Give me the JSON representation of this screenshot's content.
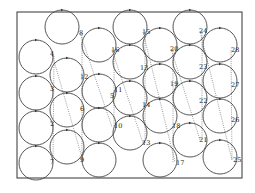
{
  "diagram": {
    "title": "",
    "frame": {
      "x": 17,
      "y": 12,
      "width": 225,
      "height": 166
    },
    "circle_radius": 17,
    "circles": [
      {
        "id": "c1",
        "cx": 36,
        "cy": 57
      },
      {
        "id": "c2",
        "cx": 36,
        "cy": 93
      },
      {
        "id": "c3",
        "cx": 36,
        "cy": 128
      },
      {
        "id": "c4",
        "cx": 36,
        "cy": 163
      },
      {
        "id": "c5",
        "cx": 62,
        "cy": 27
      },
      {
        "id": "c6",
        "cx": 67,
        "cy": 75
      },
      {
        "id": "c7",
        "cx": 67,
        "cy": 110
      },
      {
        "id": "c8",
        "cx": 67,
        "cy": 147
      },
      {
        "id": "c9",
        "cx": 99,
        "cy": 45
      },
      {
        "id": "c10",
        "cx": 99,
        "cy": 91
      },
      {
        "id": "c11",
        "cx": 99,
        "cy": 125
      },
      {
        "id": "c12",
        "cx": 99,
        "cy": 160
      },
      {
        "id": "c13",
        "cx": 130,
        "cy": 27
      },
      {
        "id": "c14",
        "cx": 130,
        "cy": 62
      },
      {
        "id": "c15",
        "cx": 130,
        "cy": 98
      },
      {
        "id": "c16",
        "cx": 130,
        "cy": 133
      },
      {
        "id": "c17",
        "cx": 160,
        "cy": 45
      },
      {
        "id": "c18",
        "cx": 160,
        "cy": 81
      },
      {
        "id": "c19",
        "cx": 160,
        "cy": 116
      },
      {
        "id": "c20",
        "cx": 160,
        "cy": 160
      },
      {
        "id": "c21",
        "cx": 190,
        "cy": 27
      },
      {
        "id": "c22",
        "cx": 190,
        "cy": 62
      },
      {
        "id": "c23",
        "cx": 190,
        "cy": 98
      },
      {
        "id": "c24",
        "cx": 190,
        "cy": 140
      },
      {
        "id": "c25",
        "cx": 220,
        "cy": 45
      },
      {
        "id": "c26",
        "cx": 220,
        "cy": 81
      },
      {
        "id": "c27",
        "cx": 220,
        "cy": 116
      },
      {
        "id": "c28",
        "cx": 220,
        "cy": 157
      }
    ],
    "labels": [
      {
        "text": "8",
        "x": 79,
        "y": 35
      },
      {
        "text": "4",
        "x": 50,
        "y": 56
      },
      {
        "text": "3",
        "x": 50,
        "y": 91
      },
      {
        "text": "2",
        "x": 50,
        "y": 126
      },
      {
        "text": "7",
        "x": 50,
        "y": 164
      },
      {
        "text": "12",
        "x": 80,
        "y": 79
      },
      {
        "text": "6",
        "x": 80,
        "y": 111
      },
      {
        "text": "9",
        "x": 80,
        "y": 162
      },
      {
        "text": "16",
        "x": 111,
        "y": 52
      },
      {
        "text": "5",
        "x": 110,
        "y": 98
      },
      {
        "text": "11",
        "x": 114,
        "y": 92
      },
      {
        "text": "10",
        "x": 114,
        "y": 128
      },
      {
        "text": "15",
        "x": 142,
        "y": 34
      },
      {
        "text": "13",
        "x": 140,
        "y": 70
      },
      {
        "text": "14",
        "x": 142,
        "y": 107
      },
      {
        "text": "13",
        "x": 142,
        "y": 145
      },
      {
        "text": "20",
        "x": 170,
        "y": 51
      },
      {
        "text": "19",
        "x": 170,
        "y": 86
      },
      {
        "text": "18",
        "x": 172,
        "y": 128
      },
      {
        "text": "17",
        "x": 176,
        "y": 165
      },
      {
        "text": "24",
        "x": 199,
        "y": 33
      },
      {
        "text": "23",
        "x": 199,
        "y": 69
      },
      {
        "text": "22",
        "x": 199,
        "y": 103
      },
      {
        "text": "21",
        "x": 199,
        "y": 142
      },
      {
        "text": "28",
        "x": 231,
        "y": 52
      },
      {
        "text": "27",
        "x": 231,
        "y": 87
      },
      {
        "text": "26",
        "x": 231,
        "y": 122
      },
      {
        "text": "25",
        "x": 233,
        "y": 162
      }
    ],
    "dotted_lines": [
      {
        "x1": 52,
        "y1": 54,
        "x2": 83,
        "y2": 161
      },
      {
        "x1": 54,
        "y1": 56,
        "x2": 53,
        "y2": 160
      },
      {
        "x1": 80,
        "y1": 33,
        "x2": 112,
        "y2": 127
      },
      {
        "x1": 82,
        "y1": 33,
        "x2": 82,
        "y2": 160
      },
      {
        "x1": 112,
        "y1": 50,
        "x2": 143,
        "y2": 143
      },
      {
        "x1": 114,
        "y1": 50,
        "x2": 114,
        "y2": 127
      },
      {
        "x1": 143,
        "y1": 32,
        "x2": 175,
        "y2": 162
      },
      {
        "x1": 145,
        "y1": 32,
        "x2": 145,
        "y2": 143
      },
      {
        "x1": 171,
        "y1": 49,
        "x2": 200,
        "y2": 140
      },
      {
        "x1": 173,
        "y1": 49,
        "x2": 173,
        "y2": 162
      },
      {
        "x1": 200,
        "y1": 31,
        "x2": 232,
        "y2": 160
      },
      {
        "x1": 202,
        "y1": 31,
        "x2": 202,
        "y2": 140
      },
      {
        "x1": 231,
        "y1": 50,
        "x2": 232,
        "y2": 160
      }
    ]
  }
}
